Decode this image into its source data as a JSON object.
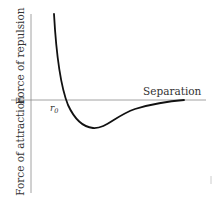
{
  "diagram": {
    "type": "force-vs-separation",
    "labels": {
      "x_axis": "Separation",
      "y_axis_positive": "Force of repulsion",
      "y_axis_negative": "Force of attraction",
      "equilibrium": "r",
      "equilibrium_sub": "0"
    },
    "colors": {
      "axis": "#888888",
      "curve": "#111111",
      "text": "#333333"
    }
  }
}
